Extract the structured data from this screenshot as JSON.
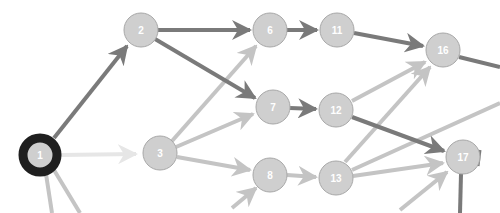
{
  "diagram": {
    "type": "directed-graph",
    "colors": {
      "background": "#ffffff",
      "node_fill": "#cfcfcf",
      "node_stroke": "#a8a8a8",
      "node_label": "#ffffff",
      "selected_ring": "#1f1f1f",
      "edge_dark": "#7a7a7a",
      "edge_light": "#c4c4c4",
      "edge_faint": "#e6e6e6"
    },
    "nodes": [
      {
        "id": "1",
        "label": "1",
        "x": 40,
        "y": 155,
        "selected": true
      },
      {
        "id": "2",
        "label": "2",
        "x": 141,
        "y": 30
      },
      {
        "id": "3",
        "label": "3",
        "x": 160,
        "y": 153
      },
      {
        "id": "6",
        "label": "6",
        "x": 270,
        "y": 30
      },
      {
        "id": "7",
        "label": "7",
        "x": 273,
        "y": 107
      },
      {
        "id": "8",
        "label": "8",
        "x": 270,
        "y": 175
      },
      {
        "id": "11",
        "label": "11",
        "x": 337,
        "y": 30
      },
      {
        "id": "12",
        "label": "12",
        "x": 336,
        "y": 110
      },
      {
        "id": "13",
        "label": "13",
        "x": 336,
        "y": 178
      },
      {
        "id": "16",
        "label": "16",
        "x": 443,
        "y": 50
      },
      {
        "id": "17",
        "label": "17",
        "x": 463,
        "y": 157
      }
    ],
    "edges": [
      {
        "from": "1",
        "to": "2",
        "style": "dark"
      },
      {
        "from": "1",
        "to": "3",
        "style": "faint"
      },
      {
        "from": "2",
        "to": "6",
        "style": "dark"
      },
      {
        "from": "2",
        "to": "7",
        "style": "dark"
      },
      {
        "from": "3",
        "to": "6",
        "style": "light"
      },
      {
        "from": "3",
        "to": "7",
        "style": "light"
      },
      {
        "from": "3",
        "to": "8",
        "style": "light"
      },
      {
        "from": "6",
        "to": "11",
        "style": "dark"
      },
      {
        "from": "7",
        "to": "12",
        "style": "dark"
      },
      {
        "from": "8",
        "to": "13",
        "style": "light"
      },
      {
        "from": "11",
        "to": "16",
        "style": "dark"
      },
      {
        "from": "12",
        "to": "16",
        "style": "light"
      },
      {
        "from": "12",
        "to": "17",
        "style": "dark"
      },
      {
        "from": "13",
        "to": "16",
        "style": "light"
      },
      {
        "from": "13",
        "to": "17",
        "style": "light"
      },
      {
        "from": "13",
        "to": "offscreen-right",
        "style": "light"
      },
      {
        "from": "16",
        "to": "offscreen-right",
        "style": "dark"
      },
      {
        "from": "17",
        "to": "offscreen-bottom",
        "style": "dark"
      },
      {
        "from": "offscreen-bottom",
        "to": "8",
        "style": "light"
      },
      {
        "from": "offscreen-bottom",
        "to": "17",
        "style": "light"
      },
      {
        "from": "1",
        "to": "offscreen-bottom-a",
        "style": "light"
      },
      {
        "from": "1",
        "to": "offscreen-bottom-b",
        "style": "light"
      }
    ]
  }
}
